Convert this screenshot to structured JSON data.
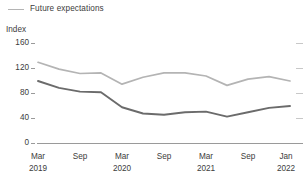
{
  "legend": {
    "position": "top-left",
    "entries": [
      {
        "label": "Future expectations",
        "color": "#b4b4b4",
        "marker": "line-swatch"
      }
    ]
  },
  "axis": {
    "y_title": "Index",
    "y_ticks": [
      "0",
      "40",
      "80",
      "120",
      "160"
    ],
    "x_ticks": [
      {
        "month": "Mar",
        "year": "2019"
      },
      {
        "month": "Sep",
        "year": ""
      },
      {
        "month": "Mar",
        "year": "2020"
      },
      {
        "month": "Sep",
        "year": ""
      },
      {
        "month": "Mar",
        "year": "2021"
      },
      {
        "month": "Sep",
        "year": ""
      },
      {
        "month": "Jan",
        "year": "2022"
      }
    ]
  },
  "colors": {
    "future_expectations_line": "#b4b4b4",
    "current_situation_line": "#6b6b6b",
    "axis": "#9a9a9a",
    "text": "#3c3c3c",
    "background": "#ffffff"
  },
  "chart_data": {
    "type": "line",
    "title": "",
    "subtitle": "",
    "xlabel": "",
    "ylabel": "Index",
    "ylim": [
      0,
      160
    ],
    "yticks": [
      0,
      40,
      80,
      120,
      160
    ],
    "grid": false,
    "legend_position": "top-left",
    "x": [
      "Mar 2019",
      "Jun 2019",
      "Sep 2019",
      "Dec 2019",
      "Mar 2020",
      "Jun 2020",
      "Sep 2020",
      "Dec 2020",
      "Mar 2021",
      "Jun 2021",
      "Sep 2021",
      "Dec 2021",
      "Jan 2022"
    ],
    "xtick_labels": [
      "Mar 2019",
      "Sep",
      "Mar 2020",
      "Sep",
      "Mar 2021",
      "Sep",
      "Jan 2022"
    ],
    "series": [
      {
        "name": "Future expectations",
        "color": "#b4b4b4",
        "values": [
          130,
          119,
          112,
          113,
          95,
          106,
          113,
          113,
          108,
          93,
          103,
          107,
          100
        ]
      },
      {
        "name": "Current situation",
        "color": "#6b6b6b",
        "labelled": false,
        "values": [
          100,
          89,
          83,
          82,
          58,
          48,
          46,
          50,
          51,
          43,
          50,
          57,
          60
        ]
      }
    ]
  }
}
